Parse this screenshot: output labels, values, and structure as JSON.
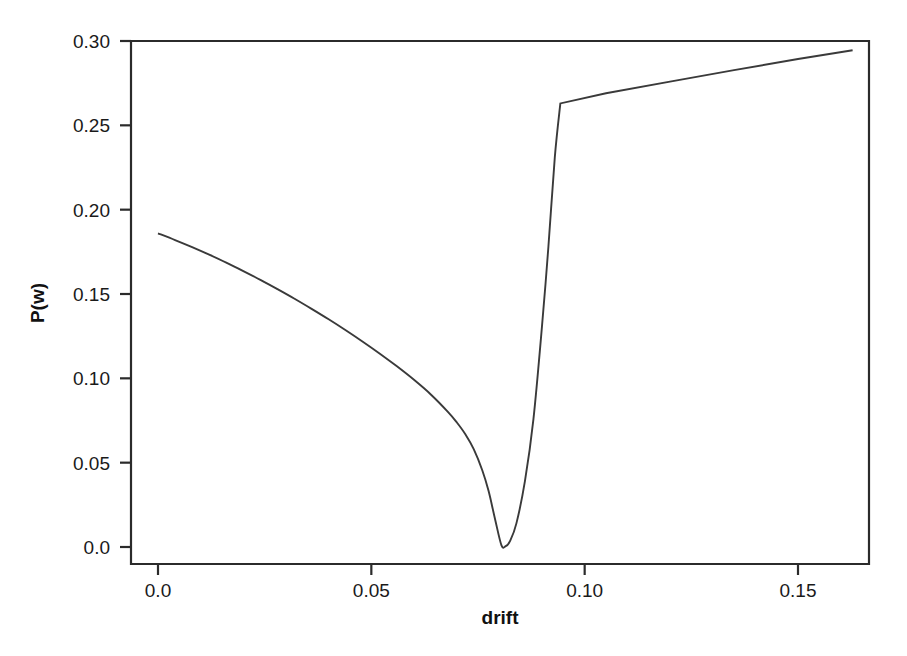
{
  "figure": {
    "background_color": "#ffffff",
    "frame_color": "#2b2b2b",
    "curve_color": "#3a3a3a"
  },
  "axes": {
    "x_title": "drift",
    "y_title": "P(w)",
    "x_tick_labels": [
      "0.0",
      "0.05",
      "0.10",
      "0.15"
    ],
    "x_tick_values": [
      0.0,
      0.05,
      0.1,
      0.15
    ],
    "y_tick_labels": [
      "0.0",
      "0.05",
      "0.10",
      "0.15",
      "0.20",
      "0.25",
      "0.30"
    ],
    "y_tick_values": [
      0.0,
      0.05,
      0.1,
      0.15,
      0.2,
      0.25,
      0.3
    ]
  },
  "chart_data": {
    "type": "line",
    "title": "",
    "xlabel": "drift",
    "ylabel": "P(w)",
    "xlim": [
      -0.0066,
      0.1746
    ],
    "ylim": [
      -0.0101,
      0.31
    ],
    "grid": false,
    "legend": null,
    "series": [
      {
        "name": "P(w)",
        "color": "#3a3a3a",
        "x": [
          0.0,
          0.004,
          0.008,
          0.012,
          0.016,
          0.02,
          0.024,
          0.028,
          0.032,
          0.036,
          0.04,
          0.044,
          0.048,
          0.052,
          0.056,
          0.06,
          0.064,
          0.068,
          0.07,
          0.072,
          0.074,
          0.076,
          0.0775,
          0.079,
          0.0805,
          0.0815,
          0.0825,
          0.084,
          0.086,
          0.088,
          0.09,
          0.0915,
          0.093,
          0.0943,
          0.0943,
          0.105,
          0.12,
          0.135,
          0.15,
          0.1628
        ],
        "y": [
          0.186,
          0.182,
          0.1778,
          0.1733,
          0.1686,
          0.1636,
          0.1584,
          0.1529,
          0.1472,
          0.1412,
          0.135,
          0.1285,
          0.1217,
          0.1146,
          0.1071,
          0.0991,
          0.0903,
          0.08,
          0.074,
          0.067,
          0.058,
          0.0455,
          0.033,
          0.0165,
          0.001,
          0.0005,
          0.0035,
          0.014,
          0.039,
          0.076,
          0.131,
          0.178,
          0.231,
          0.263,
          0.263,
          0.269,
          0.2759,
          0.2827,
          0.2893,
          0.2945
        ]
      }
    ],
    "annotations": [
      {
        "label": "minimum",
        "x": 0.0805,
        "y": 0.001
      },
      {
        "label": "kink",
        "x": 0.0943,
        "y": 0.263
      },
      {
        "label": "left endpoint",
        "x": 0.0,
        "y": 0.186
      },
      {
        "label": "right endpoint",
        "x": 0.1628,
        "y": 0.2945
      }
    ]
  }
}
